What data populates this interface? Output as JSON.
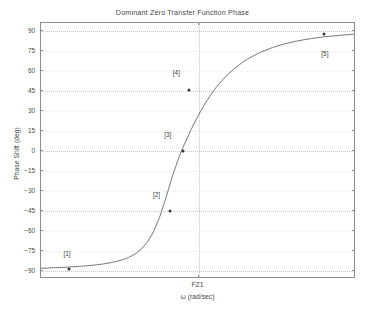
{
  "chart_data": {
    "type": "line",
    "title": "Dominant Zero Transfer Function Phase",
    "xlabel": "ω (rad/sec)",
    "ylabel": "Phase Shift (deg)",
    "ylim": [
      -96,
      96
    ],
    "yticks": [
      90,
      75,
      60,
      45,
      30,
      15,
      0,
      -15,
      -30,
      -45,
      -60,
      -75,
      -90
    ],
    "ytick_labels": [
      "90",
      "75",
      "60",
      "45",
      "30",
      "15",
      "0",
      "−15",
      "−30",
      "−45",
      "−60",
      "−75",
      "−90"
    ],
    "major_gridlines": [
      90,
      45,
      0,
      -45,
      -90
    ],
    "xticks": [
      0.5
    ],
    "xtick_labels": [
      "FZ1"
    ],
    "grid": true,
    "legend": null,
    "series": [
      {
        "name": "Phase",
        "comment": "Arctangent phase of a dominant zero; asymptotes at -90 and +90 deg",
        "x": [
          0.0,
          0.02,
          0.04,
          0.06,
          0.08,
          0.1,
          0.12,
          0.14,
          0.16,
          0.18,
          0.2,
          0.22,
          0.24,
          0.26,
          0.28,
          0.3,
          0.32,
          0.34,
          0.36,
          0.38,
          0.4,
          0.42,
          0.44,
          0.45,
          0.46,
          0.47,
          0.48,
          0.49,
          0.5,
          0.51,
          0.52,
          0.53,
          0.54,
          0.55,
          0.56,
          0.58,
          0.6,
          0.62,
          0.64,
          0.66,
          0.68,
          0.7,
          0.74,
          0.78,
          0.82,
          0.86,
          0.9,
          0.95,
          1.0
        ],
        "y": [
          -89.4,
          -89.2,
          -89.0,
          -88.8,
          -88.6,
          -88.3,
          -88.0,
          -87.6,
          -87.2,
          -86.7,
          -86.1,
          -85.3,
          -84.3,
          -83.0,
          -81.2,
          -78.7,
          -75.0,
          -69.6,
          -61.5,
          -50.1,
          -35.5,
          -19.5,
          -6.0,
          -0.1,
          5.4,
          10.6,
          15.6,
          20.4,
          25.0,
          29.3,
          33.4,
          37.2,
          40.8,
          44.2,
          47.4,
          53.0,
          57.9,
          62.0,
          65.6,
          68.7,
          71.4,
          73.7,
          77.5,
          80.3,
          82.5,
          84.1,
          85.4,
          86.6,
          87.5
        ]
      }
    ],
    "points": [
      {
        "label": "[1]",
        "x": 0.089,
        "y": -88.5,
        "label_dx": -2,
        "label_dy": -16
      },
      {
        "label": "[2]",
        "x": 0.411,
        "y": -44.9,
        "label_dx": -14,
        "label_dy": -17
      },
      {
        "label": "[3]",
        "x": 0.45,
        "y": 0.0,
        "label_dx": -15,
        "label_dy": -17
      },
      {
        "label": "[4]",
        "x": 0.471,
        "y": 45.4,
        "label_dx": -13,
        "label_dy": -18
      },
      {
        "label": "[5]",
        "x": 0.898,
        "y": 88.0,
        "label_dx": 1,
        "label_dy": 19
      }
    ],
    "colors": {
      "curve": "#555555",
      "marker": "#333333",
      "axis": "#8d8d8d",
      "grid_major": "#c8c8c8",
      "grid_minor": "#eeeeee",
      "text": "#4a4a4a",
      "background": "#ffffff"
    }
  }
}
